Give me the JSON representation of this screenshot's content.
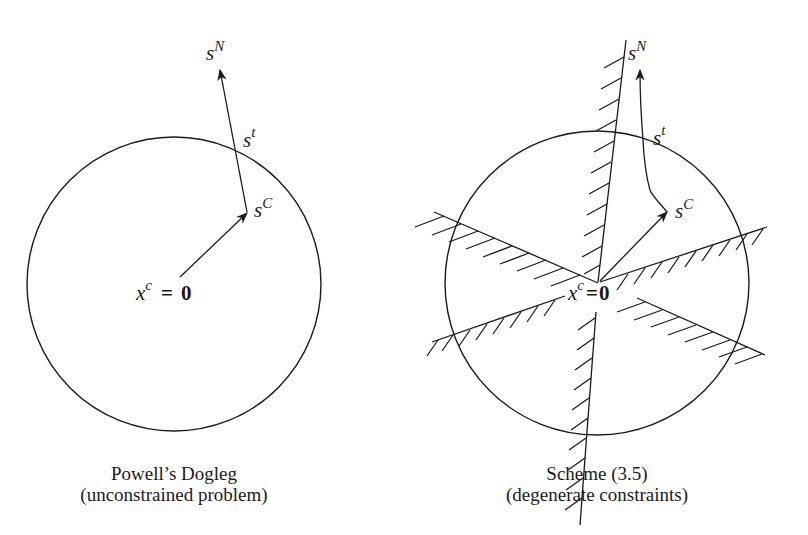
{
  "figures": [
    {
      "id": "left",
      "caption_line1": "Powell’s Dogleg",
      "caption_line2": "(unconstrained problem)",
      "labels": {
        "sN": {
          "base": "s",
          "sup": "N"
        },
        "st": {
          "base": "s",
          "sup": "t"
        },
        "sC": {
          "base": "s",
          "sup": "C"
        },
        "xc": {
          "base": "x",
          "sup": "c",
          "eq": "=",
          "zero": "0"
        }
      }
    },
    {
      "id": "right",
      "caption_line1": "Scheme (3.5)",
      "caption_line2": "(degenerate constraints)",
      "labels": {
        "sN": {
          "base": "s",
          "sup": "N"
        },
        "st": {
          "base": "s",
          "sup": "t"
        },
        "sC": {
          "base": "s",
          "sup": "C"
        },
        "xc": {
          "base": "x",
          "sup": "c",
          "eq": "=",
          "zero": "0"
        }
      }
    }
  ],
  "colors": {
    "ink": "#1a1a1a",
    "background": "#ffffff"
  }
}
